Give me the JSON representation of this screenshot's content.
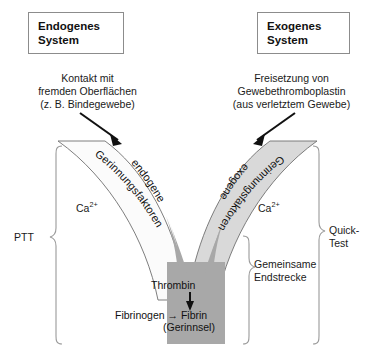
{
  "diagram": {
    "title_boxes": [
      {
        "id": "endogen",
        "label": "Endogenes\nSystem"
      },
      {
        "id": "exogen",
        "label": "Exogenes\nSystem"
      }
    ],
    "captions": {
      "left": "Kontakt mit\nfremden Oberflächen\n(z. B. Bindegewebe)",
      "right": "Freisetzung von\nGewebethromboplastin\n(aus verletztem Gewebe)"
    },
    "arc_labels": {
      "left_line1": "endogene",
      "left_line2": "Gerinnungsfaktoren",
      "right_line1": "exogene",
      "right_line2": "Gerinnungsfaktoren"
    },
    "cofactors": {
      "left": {
        "text": "Ca",
        "superscript": "2+"
      },
      "right": {
        "text": "Ca",
        "superscript": "2+"
      }
    },
    "stem": {
      "thrombin": "Thrombin",
      "fibrinogen_to_fibrin": "Fibrinogen → Fibrin",
      "clot": "(Gerinnsel)"
    },
    "brackets": {
      "ptt": "PTT",
      "quick_test": "Quick-\nTest",
      "common_pathway": "Gemeinsame\nEndstrecke"
    },
    "colors": {
      "endogenous_arm_fill": "#fbfbfb",
      "exogenous_arm_fill": "#d9d9d9",
      "common_stem_fill": "#a8a8a8",
      "outline": "#6f6f6f",
      "bracket": "#9a9a9a",
      "arrow": "#111111",
      "box_border": "#8c8c8c",
      "text": "#1a1a1a",
      "background": "#ffffff"
    }
  }
}
